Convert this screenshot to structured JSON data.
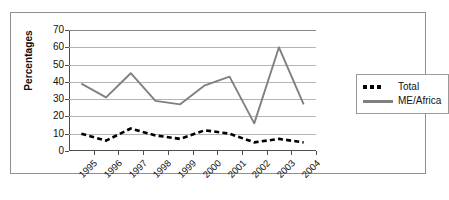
{
  "chart_data": {
    "type": "line",
    "title": "",
    "xlabel": "",
    "ylabel": "Percentages",
    "ylim": [
      0,
      70
    ],
    "ytick_step": 10,
    "yticks": [
      0,
      10,
      20,
      30,
      40,
      50,
      60,
      70
    ],
    "grid": true,
    "legend_position": "right",
    "categories": [
      "1995",
      "1996",
      "1997",
      "1998",
      "1999",
      "2000",
      "2001",
      "2002",
      "2003",
      "2004"
    ],
    "series": [
      {
        "name": "Total",
        "color": "#000000",
        "style": "dashed",
        "values": [
          10,
          6,
          13,
          9,
          7,
          12,
          10,
          5,
          7,
          5
        ]
      },
      {
        "name": "ME/Africa",
        "color": "#808080",
        "style": "solid",
        "values": [
          39,
          31,
          45,
          29,
          27,
          38,
          43,
          16,
          60,
          27
        ]
      }
    ]
  },
  "legend": {
    "entries": [
      {
        "label": "Total",
        "marker": "squares-icon"
      },
      {
        "label": "ME/Africa",
        "marker": "line-icon"
      }
    ]
  }
}
